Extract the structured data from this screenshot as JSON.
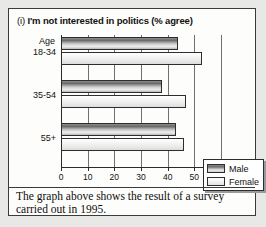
{
  "card": {
    "title_marker": "(i)",
    "title_text": "I'm not interested in politics (% agree)",
    "caption": "The graph above shows the result of a survey carried out in 1995."
  },
  "legend": {
    "male_label": "Male",
    "female_label": "Female"
  },
  "axis": {
    "category_header": "Age",
    "tick_labels": [
      "0",
      "10",
      "20",
      "30",
      "40",
      "50",
      "60%"
    ]
  },
  "chart_data": {
    "type": "bar",
    "orientation": "horizontal",
    "title": "(i) I'm not interested in politics (% agree)",
    "xlabel": "",
    "ylabel": "Age",
    "categories": [
      "18-34",
      "35-54",
      "55+"
    ],
    "series": [
      {
        "name": "Male",
        "values": [
          44,
          38,
          43
        ],
        "color": "#6a6a6a"
      },
      {
        "name": "Female",
        "values": [
          53,
          47,
          46
        ],
        "color": "#f2f2f2"
      }
    ],
    "xlim": [
      0,
      60
    ],
    "xticks": [
      0,
      10,
      20,
      30,
      40,
      50,
      60
    ],
    "xtick_labels": [
      "0",
      "10",
      "20",
      "30",
      "40",
      "50",
      "60%"
    ],
    "grid": true,
    "legend_position": "lower-right",
    "units": "percent agree"
  }
}
